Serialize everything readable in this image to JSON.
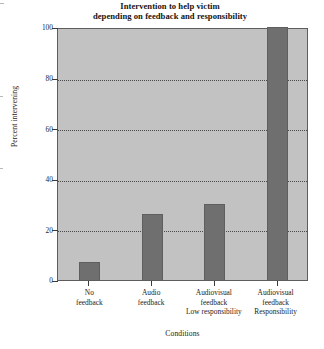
{
  "chart_data": {
    "type": "bar",
    "title": "Intervention to help victim depending on feedback and responsibility",
    "title_lines": [
      "Intervention to help victim",
      "depending on feedback and responsibility"
    ],
    "xlabel": "Conditions",
    "ylabel": "Percent intervening",
    "categories": [
      "No feedback",
      "Audio feedback",
      "Audiovisual feedback Low responsibility",
      "Audiovisual feedback Responsibility"
    ],
    "category_lines": [
      [
        "No",
        "feedback"
      ],
      [
        "Audio",
        "feedback"
      ],
      [
        "Audiovisual",
        "feedback",
        "Low responsibility"
      ],
      [
        "Audiovisual",
        "feedback",
        "Responsibility"
      ]
    ],
    "values": [
      7,
      26,
      30,
      100
    ],
    "ylim": [
      0,
      100
    ],
    "yticks": [
      0,
      20,
      40,
      60,
      80,
      100
    ],
    "ytick_labels": [
      "0",
      "20",
      "40",
      "60",
      "80",
      "100"
    ],
    "grid": true,
    "legend": false,
    "colors": {
      "bar": "#6f6f6f",
      "plot_background": "#c2c2c2",
      "axis": "#3a3a3a",
      "grid": "#4a4a4a",
      "text": "#1b1b1b",
      "page_background": "#ffffff"
    }
  }
}
